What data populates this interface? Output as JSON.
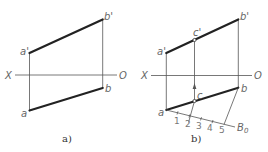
{
  "figures": [
    {
      "caption": "a)",
      "axis": {
        "left_label": "X",
        "right_label": "O"
      },
      "points": {
        "a_prime": "a'",
        "b_prime": "b'",
        "a": "a",
        "b": "b"
      }
    },
    {
      "caption": "b)",
      "axis": {
        "left_label": "X",
        "right_label": "O"
      },
      "points": {
        "a_prime": "a'",
        "b_prime": "b'",
        "c_prime": "c'",
        "a": "a",
        "b": "b",
        "c": "c"
      },
      "auxiliary_line": {
        "end_label": "B",
        "end_subscript": "0",
        "ticks": [
          "1",
          "2",
          "3",
          "4",
          "5"
        ]
      }
    }
  ]
}
